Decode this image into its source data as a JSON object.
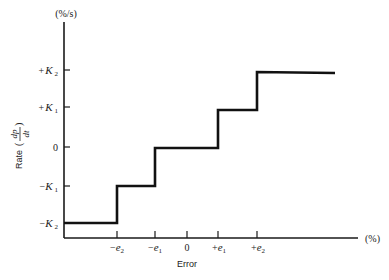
{
  "diagram": {
    "y_axis": {
      "unit": "(%/s)",
      "label_text": "Rate",
      "label_math_num": "dp",
      "label_math_den": "dt",
      "ticks": [
        {
          "sign": "+",
          "symbol": "K",
          "sub": "2",
          "value": 2
        },
        {
          "sign": "+",
          "symbol": "K",
          "sub": "1",
          "value": 1
        },
        {
          "sign": "",
          "symbol": "0",
          "sub": "",
          "value": 0
        },
        {
          "sign": "−",
          "symbol": "K",
          "sub": "1",
          "value": -1
        },
        {
          "sign": "−",
          "symbol": "K",
          "sub": "2",
          "value": -2
        }
      ]
    },
    "x_axis": {
      "unit": "(%)",
      "label": "Error",
      "ticks": [
        {
          "sign": "−",
          "symbol": "e",
          "sub": "2",
          "value": -2
        },
        {
          "sign": "−",
          "symbol": "e",
          "sub": "1",
          "value": -1
        },
        {
          "sign": "",
          "symbol": "0",
          "sub": "",
          "value": 0
        },
        {
          "sign": "+",
          "symbol": "e",
          "sub": "1",
          "value": 1
        },
        {
          "sign": "+",
          "symbol": "e",
          "sub": "2",
          "value": 2
        }
      ]
    },
    "curve": {
      "type": "staircase",
      "description": "Multi-step floating controller output rate vs error",
      "steps": [
        {
          "x_from": "-inf",
          "x_to": "-e2",
          "rate": "-K2"
        },
        {
          "x_from": "-e2",
          "x_to": "-e1",
          "rate": "-K1"
        },
        {
          "x_from": "-e1",
          "x_to": "+e1",
          "rate": "0"
        },
        {
          "x_from": "+e1",
          "x_to": "+e2",
          "rate": "+K1"
        },
        {
          "x_from": "+e2",
          "x_to": "+inf",
          "rate": "+K2"
        }
      ]
    }
  }
}
